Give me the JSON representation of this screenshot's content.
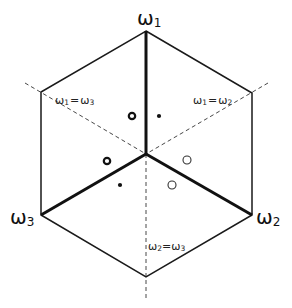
{
  "diagram": {
    "vertices": {
      "top": {
        "name": "ω",
        "sub": "1"
      },
      "bottom_right": {
        "name": "ω",
        "sub": "2"
      },
      "bottom_left": {
        "name": "ω",
        "sub": "3"
      }
    },
    "equality_lines": [
      {
        "id": "w1-eq-w3",
        "left": "ω",
        "left_sub": "1",
        "op": "=",
        "right": "ω",
        "right_sub": "3"
      },
      {
        "id": "w1-eq-w2",
        "left": "ω",
        "left_sub": "1",
        "op": "=",
        "right": "ω",
        "right_sub": "2"
      },
      {
        "id": "w2-eq-w3",
        "left": "ω",
        "left_sub": "2",
        "op": "=",
        "right": "ω",
        "right_sub": "3"
      }
    ],
    "markers": [
      {
        "id": "m1",
        "kind": "open-circle-thick",
        "region": "upper-left of ω1 axis"
      },
      {
        "id": "m2",
        "kind": "filled-dot",
        "region": "upper-right of ω1 axis"
      },
      {
        "id": "m3",
        "kind": "open-circle-thick",
        "region": "left, near ω3 boundary above"
      },
      {
        "id": "m4",
        "kind": "open-circle-thin",
        "region": "right, near ω2 boundary above"
      },
      {
        "id": "m5",
        "kind": "filled-dot",
        "region": "lower-left of ω2=ω3 line"
      },
      {
        "id": "m6",
        "kind": "open-circle-thin",
        "region": "lower-right of ω2=ω3 line"
      }
    ]
  }
}
